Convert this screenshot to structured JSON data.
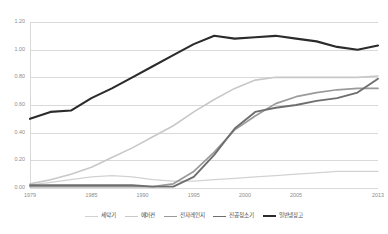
{
  "chart_data": {
    "type": "line",
    "title": "",
    "subtitle": "",
    "xlabel": "",
    "ylabel": "",
    "grid": true,
    "legend_position": "bottom",
    "xlim": [
      1979,
      2013
    ],
    "ylim": [
      0.0,
      1.2
    ],
    "y_ticks": [
      "1.20",
      "1.00",
      "0.80",
      "0.60",
      "0.40",
      "0.20",
      "0.00"
    ],
    "y_tick_values": [
      1.2,
      1.0,
      0.8,
      0.6,
      0.4,
      0.2,
      0.0
    ],
    "x_ticks": [
      "1979",
      "1985",
      "1990",
      "1995",
      "2000",
      "2005",
      "2013"
    ],
    "x_tick_values": [
      1979,
      1985,
      1990,
      1995,
      2000,
      2005,
      2013
    ],
    "x": [
      1979,
      1981,
      1983,
      1985,
      1987,
      1989,
      1991,
      1993,
      1995,
      1997,
      1999,
      2001,
      2003,
      2005,
      2007,
      2009,
      2011,
      2013
    ],
    "series": [
      {
        "name": "세탁기",
        "color": "#d2d2d2",
        "width": 1.3,
        "values": [
          0.02,
          0.04,
          0.06,
          0.08,
          0.09,
          0.08,
          0.06,
          0.05,
          0.05,
          0.06,
          0.07,
          0.08,
          0.09,
          0.1,
          0.11,
          0.12,
          0.12,
          0.12
        ]
      },
      {
        "name": "에어컨",
        "color": "#c8c8c8",
        "width": 1.6,
        "values": [
          0.03,
          0.06,
          0.1,
          0.15,
          0.22,
          0.29,
          0.37,
          0.45,
          0.55,
          0.64,
          0.72,
          0.78,
          0.8,
          0.8,
          0.8,
          0.8,
          0.8,
          0.81
        ]
      },
      {
        "name": "전자레인지",
        "color": "#9a9a9a",
        "width": 1.7,
        "values": [
          0.01,
          0.01,
          0.01,
          0.01,
          0.01,
          0.01,
          0.01,
          0.03,
          0.12,
          0.26,
          0.42,
          0.52,
          0.61,
          0.66,
          0.69,
          0.71,
          0.72,
          0.72
        ]
      },
      {
        "name": "진공청소기",
        "color": "#6e6e6e",
        "width": 1.9,
        "values": [
          0.02,
          0.02,
          0.02,
          0.02,
          0.02,
          0.02,
          0.01,
          0.01,
          0.08,
          0.24,
          0.43,
          0.55,
          0.58,
          0.6,
          0.63,
          0.65,
          0.69,
          0.79
        ]
      },
      {
        "name": "일반냉장고",
        "color": "#2b2b2b",
        "width": 2.1,
        "values": [
          0.5,
          0.55,
          0.56,
          0.65,
          0.72,
          0.8,
          0.88,
          0.96,
          1.04,
          1.1,
          1.08,
          1.09,
          1.1,
          1.08,
          1.06,
          1.02,
          1.0,
          1.03
        ]
      }
    ]
  },
  "axis": {
    "grid_color": "#d9d9d9",
    "tick_text_color": "#8c8c8c"
  },
  "legend": {
    "items": [
      {
        "label": "세탁기",
        "color": "#d2d2d2",
        "width": 1.3
      },
      {
        "label": "에어컨",
        "color": "#c8c8c8",
        "width": 1.6
      },
      {
        "label": "전자레인지",
        "color": "#9a9a9a",
        "width": 1.7
      },
      {
        "label": "진공청소기",
        "color": "#6e6e6e",
        "width": 1.9
      },
      {
        "label": "일반냉장고",
        "color": "#2b2b2b",
        "width": 2.1
      }
    ]
  }
}
